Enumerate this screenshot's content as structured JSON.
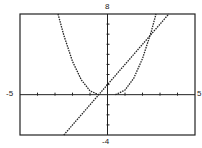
{
  "chart_data": {
    "type": "line",
    "title": "",
    "xlabel": "",
    "ylabel": "",
    "xlim": [
      -5,
      5
    ],
    "ylim": [
      -4,
      8
    ],
    "grid": false,
    "legend": null,
    "tick_labels": {
      "x_min": "-5",
      "x_max": "5",
      "y_min": "-4",
      "y_max": "8"
    },
    "x_tick_step": 1,
    "y_tick_step": 1,
    "series": [
      {
        "name": "parabola-left",
        "style": "dotted",
        "points": [
          [
            -2.83,
            8
          ],
          [
            -2.5,
            5.9
          ],
          [
            -2.0,
            3.3
          ],
          [
            -1.5,
            1.47
          ],
          [
            -1.0,
            0.37
          ],
          [
            -0.5,
            0
          ]
        ]
      },
      {
        "name": "line",
        "style": "dotted",
        "points": [
          [
            -2.5,
            -4
          ],
          [
            0,
            1
          ],
          [
            3.5,
            8
          ]
        ]
      },
      {
        "name": "parabola-right",
        "style": "dotted",
        "points": [
          [
            0.45,
            0
          ],
          [
            1.0,
            0.45
          ],
          [
            1.5,
            1.64
          ],
          [
            2.0,
            3.58
          ],
          [
            2.5,
            6.26
          ],
          [
            2.77,
            8
          ]
        ]
      }
    ]
  }
}
